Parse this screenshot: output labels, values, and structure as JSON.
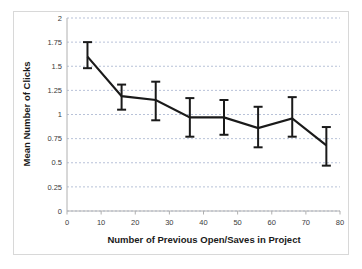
{
  "chart_data": {
    "type": "line",
    "title": "",
    "xlabel": "Number of Previous Open/Saves in Project",
    "ylabel": "Mean Number of Clicks",
    "xlim": [
      0,
      80
    ],
    "ylim": [
      0,
      2
    ],
    "grid": true,
    "grid_axis": "y",
    "legend": false,
    "x": [
      6,
      16,
      26,
      36,
      46,
      56,
      66,
      76
    ],
    "values": [
      1.6,
      1.19,
      1.15,
      0.97,
      0.97,
      0.86,
      0.96,
      0.68
    ],
    "error_low": [
      1.48,
      1.05,
      0.94,
      0.77,
      0.79,
      0.66,
      0.77,
      0.47
    ],
    "error_high": [
      1.75,
      1.31,
      1.34,
      1.17,
      1.15,
      1.08,
      1.18,
      0.87
    ],
    "series": [
      {
        "name": "Mean Number of Clicks",
        "values": [
          1.6,
          1.19,
          1.15,
          0.97,
          0.97,
          0.86,
          0.96,
          0.68
        ]
      }
    ],
    "xticks": [
      0,
      10,
      20,
      30,
      40,
      50,
      60,
      70,
      80
    ],
    "xtick_labels": [
      "0",
      "10",
      "20",
      "30",
      "40",
      "50",
      "60",
      "70",
      "80"
    ],
    "yticks": [
      0,
      0.25,
      0.5,
      0.75,
      1,
      1.25,
      1.5,
      1.75,
      2
    ],
    "ytick_labels": [
      "0",
      "0.25",
      "0.5",
      "0.75",
      "1",
      "1.25",
      "1.5",
      "1.75",
      "2"
    ],
    "line_color": "#1a1a1a",
    "grid_color": "#9aa7c7",
    "background_color": "#ffffff"
  }
}
